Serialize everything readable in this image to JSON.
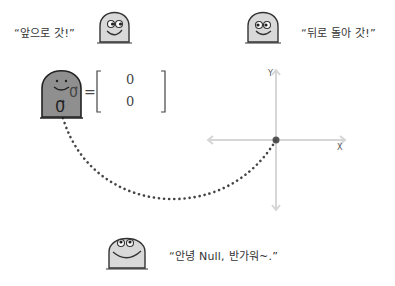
{
  "characters": [
    {
      "id": "forward",
      "speech": "“앞으로 갓!”",
      "fill": "#d9d9d9"
    },
    {
      "id": "backward",
      "speech": "“뒤로 돌아 갓!”",
      "fill": "#d9d9d9"
    },
    {
      "id": "zero-vector",
      "label": "0⃗",
      "fill": "#8f8f8f"
    },
    {
      "id": "greeting",
      "speech": "“안녕 Null, 반가워~.”",
      "fill": "#d9d9d9"
    }
  ],
  "equation": {
    "lhs": "0⃗",
    "equals": "=",
    "entries": [
      "0",
      "0"
    ]
  },
  "axes": {
    "x_label": "X",
    "y_label": "Y",
    "color": "#d6d6d6"
  },
  "path": {
    "style": "dotted",
    "color": "#444444"
  }
}
